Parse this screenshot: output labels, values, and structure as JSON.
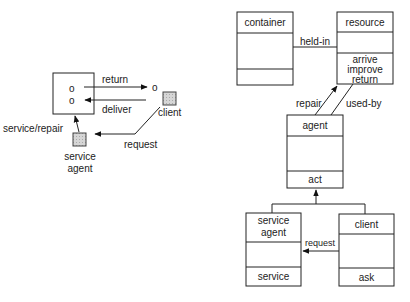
{
  "left_diagram": {
    "container_slots": [
      "o",
      "o"
    ],
    "client_object": "o",
    "arrows": {
      "return": "return",
      "deliver": "deliver",
      "request": "request",
      "service_repair": "service/repair"
    },
    "client_label": "client",
    "service_agent_label_line1": "service",
    "service_agent_label_line2": "agent"
  },
  "class_diagram": {
    "container": {
      "name": "container",
      "ops": []
    },
    "resource": {
      "name": "resource",
      "ops": [
        "arrive",
        "improve",
        "return"
      ]
    },
    "agent": {
      "name": "agent",
      "ops": [
        "act"
      ]
    },
    "service_agent": {
      "name_line1": "service",
      "name_line2": "agent",
      "ops": [
        "service"
      ]
    },
    "client": {
      "name": "client",
      "ops": [
        "ask"
      ]
    },
    "associations": {
      "held_in": "held-in",
      "repair": "repair",
      "used_by": "used-by",
      "request": "request"
    }
  }
}
